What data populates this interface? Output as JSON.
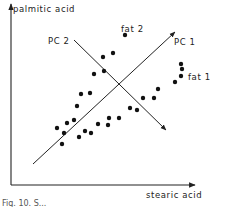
{
  "chart_data": {
    "type": "scatter",
    "title": "",
    "xlabel": "stearic acid",
    "ylabel": "palmitic acid",
    "grid": false,
    "legend": null,
    "axes_ticks": "none",
    "annotations": [
      {
        "text": "fat 1",
        "x": 190,
        "y": 79
      },
      {
        "text": "fat 2",
        "x": 120,
        "y": 30
      },
      {
        "text": "PC 1",
        "x": 176,
        "y": 43
      },
      {
        "text": "PC 2",
        "x": 46,
        "y": 42
      }
    ],
    "principal_components": [
      {
        "name": "PC 1",
        "from": [
          33,
          164
        ],
        "to": [
          175,
          32
        ]
      },
      {
        "name": "PC 2",
        "from": [
          74,
          40
        ],
        "to": [
          166,
          130
        ]
      }
    ],
    "points_pixel": [
      [
        125,
        35
      ],
      [
        103,
        57
      ],
      [
        113,
        53
      ],
      [
        94,
        74
      ],
      [
        104,
        71
      ],
      [
        81,
        94
      ],
      [
        90,
        93
      ],
      [
        77,
        106
      ],
      [
        74,
        120
      ],
      [
        67,
        123
      ],
      [
        57,
        128
      ],
      [
        64,
        133
      ],
      [
        62,
        144
      ],
      [
        79,
        137
      ],
      [
        85,
        131
      ],
      [
        91,
        133
      ],
      [
        98,
        124
      ],
      [
        109,
        118
      ],
      [
        108,
        125
      ],
      [
        119,
        118
      ],
      [
        130,
        108
      ],
      [
        137,
        110
      ],
      [
        143,
        98
      ],
      [
        154,
        98
      ],
      [
        158,
        89
      ],
      [
        175,
        82
      ],
      [
        181,
        64
      ],
      [
        182,
        69
      ],
      [
        181,
        76
      ]
    ]
  },
  "labels": {
    "x_axis": "stearic acid",
    "y_axis": "palmitic acid",
    "pc1": "PC 1",
    "pc2": "PC 2",
    "fat1": "fat 1",
    "fat2": "fat 2",
    "caption": "Fig. 10. S..."
  }
}
